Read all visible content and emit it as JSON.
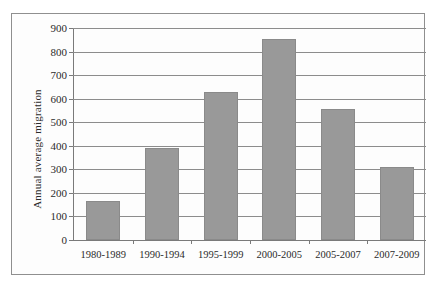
{
  "chart_data": {
    "type": "bar",
    "title": "",
    "subtitle": "",
    "xlabel": "",
    "ylabel": "Annual average migration",
    "categories": [
      "1980-1989",
      "1990-1994",
      "1995-1999",
      "2000-2005",
      "2005-2007",
      "2007-2009"
    ],
    "values": [
      165,
      390,
      628,
      853,
      555,
      308
    ],
    "ylim": [
      0,
      900
    ],
    "ytick_step": 100,
    "yticks": [
      0,
      100,
      200,
      300,
      400,
      500,
      600,
      700,
      800,
      900
    ],
    "ytick_labels": [
      "0",
      "100",
      "200",
      "300",
      "400",
      "500",
      "600",
      "700",
      "800",
      "900"
    ],
    "grid": "horizontal",
    "legend": "none",
    "series": [
      {
        "name": "Annual average migration",
        "values": [
          165,
          390,
          628,
          853,
          555,
          308
        ]
      }
    ],
    "colors": {
      "bar_fill": "#999999",
      "bar_border": "#8a8a8a",
      "gridline": "#8c8c8c",
      "axis": "#7a7a7a",
      "text": "#2b2b2b",
      "frame_border": "#8f8f8f",
      "background": "#fdfdfd"
    }
  }
}
